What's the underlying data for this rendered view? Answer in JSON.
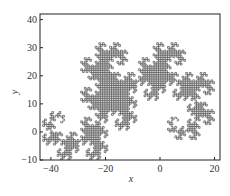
{
  "chart_data": {
    "type": "line",
    "title": "",
    "xlabel": "x",
    "ylabel": "y",
    "xlim": [
      -44,
      22
    ],
    "ylim": [
      -10,
      42
    ],
    "xticks": [
      -40,
      -20,
      0,
      20
    ],
    "yticks": [
      -10,
      0,
      10,
      20,
      30,
      40
    ],
    "grid": false,
    "legend": null,
    "series": [
      {
        "name": "dragon curve",
        "kind": "fractal",
        "iterations": 12,
        "color": "#333333"
      }
    ]
  },
  "labels": {
    "x": "x",
    "y": "y"
  }
}
